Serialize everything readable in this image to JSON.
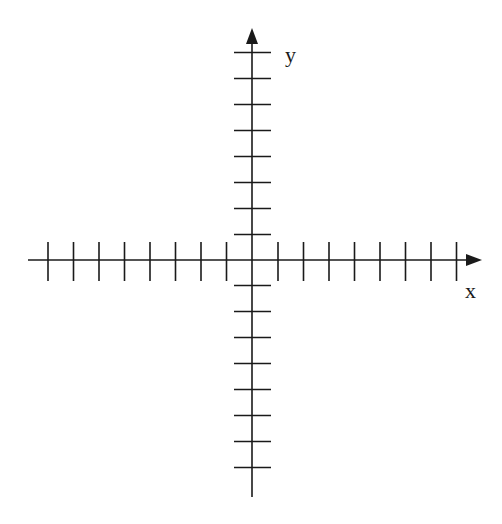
{
  "diagram": {
    "type": "cartesian-axes",
    "x_axis": {
      "label": "x",
      "ticks_negative": 8,
      "ticks_positive": 8,
      "arrow": "positive-end"
    },
    "y_axis": {
      "label": "y",
      "ticks_negative": 8,
      "ticks_positive": 8,
      "arrow": "positive-end"
    },
    "colors": {
      "line": "#1a1a1a",
      "background": "#ffffff"
    }
  },
  "geometry": {
    "origin": [
      252,
      260
    ],
    "tick_spacing_x": 25.5,
    "tick_spacing_y": 26,
    "x_start": 28,
    "x_end": 482,
    "y_start": 497,
    "y_end": 28,
    "tick_half_len_x": 18,
    "tick_half_len_y": 18
  }
}
